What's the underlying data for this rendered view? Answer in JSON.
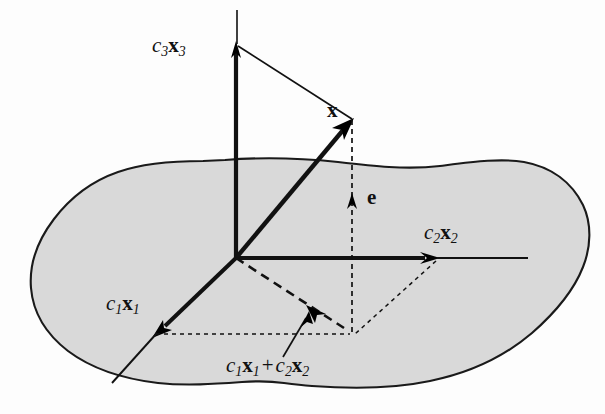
{
  "figure": {
    "type": "vector-decomposition-diagram",
    "labels": {
      "axis_c3x3": {
        "coef": "c",
        "coef_sub": "3",
        "vec": "x",
        "vec_sub": "3",
        "plain": "c3x3"
      },
      "axis_c2x2": {
        "coef": "c",
        "coef_sub": "2",
        "vec": "x",
        "vec_sub": "2",
        "plain": "c2x2"
      },
      "axis_c1x1": {
        "coef": "c",
        "coef_sub": "1",
        "vec": "x",
        "vec_sub": "1",
        "plain": "c1x1"
      },
      "vector_x": {
        "vec": "x",
        "plain": "x"
      },
      "vector_e": {
        "vec": "e",
        "plain": "e"
      },
      "projection_sum": {
        "coef_a": "c",
        "coef_a_sub": "1",
        "vec_a": "x",
        "vec_a_sub": "1",
        "operator": "+",
        "coef_b": "c",
        "coef_b_sub": "2",
        "vec_b": "x",
        "vec_b_sub": "2",
        "plain": "c1x1 + c2x2"
      }
    },
    "colors": {
      "background": "#fdfdfd",
      "plane_fill": "#d9d9d9",
      "plane_stroke": "#1a1a1a",
      "line": "#111111",
      "text": "#111111"
    },
    "geometry": {
      "origin": [
        236,
        258
      ],
      "x_tip": [
        352,
        120
      ],
      "sum_point": [
        352,
        335
      ],
      "c3x3_arrow_tip": [
        237,
        44
      ],
      "c2x2_arrow_tip": [
        437,
        258
      ],
      "c1x1_arrow_tip": [
        155,
        334
      ],
      "e_arrow_tip": [
        352,
        196
      ]
    }
  }
}
